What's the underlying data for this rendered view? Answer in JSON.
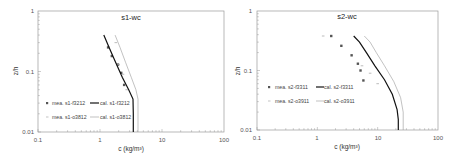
{
  "chart_data": [
    {
      "type": "scatter",
      "title": "s1-wc",
      "xlabel": "c (kg/m³)",
      "ylabel": "z/h",
      "xscale": "log",
      "yscale": "log",
      "xlim": [
        0.1,
        100
      ],
      "ylim": [
        0.01,
        1
      ],
      "xticks": [
        "0.1",
        "1",
        "10",
        "100"
      ],
      "yticks": [
        "0.01",
        "0.1",
        "1"
      ],
      "grid": false,
      "legend_position": "lower-left inside",
      "series": [
        {
          "name": "mea. s1-f3212",
          "kind": "marker",
          "marker": "square",
          "color": "#555555",
          "x": [
            1.35,
            1.55,
            1.95,
            2.2,
            2.45
          ],
          "y": [
            0.25,
            0.18,
            0.13,
            0.095,
            0.06
          ]
        },
        {
          "name": "cal. s1-f3212",
          "kind": "line",
          "style": "solid",
          "color": "#111111",
          "x": [
            1.15,
            1.4,
            1.8,
            2.3,
            2.9,
            3.4,
            3.45,
            3.45
          ],
          "y": [
            0.4,
            0.25,
            0.14,
            0.08,
            0.05,
            0.035,
            0.02,
            0.01
          ]
        },
        {
          "name": "mea. s1-o3812",
          "kind": "marker",
          "marker": "dash",
          "color": "#aaaaaa",
          "x": [
            1.8,
            2.0,
            2.35,
            2.7
          ],
          "y": [
            0.3,
            0.13,
            0.09,
            0.05
          ]
        },
        {
          "name": "cal. s1-o3812",
          "kind": "line",
          "style": "solid-thin",
          "color": "#999999",
          "x": [
            1.75,
            2.1,
            2.6,
            3.2,
            3.8,
            4.1,
            4.1
          ],
          "y": [
            0.4,
            0.25,
            0.14,
            0.08,
            0.05,
            0.035,
            0.01
          ]
        }
      ]
    },
    {
      "type": "scatter",
      "title": "s2-wc",
      "xlabel": "c (kg/m³)",
      "ylabel": "z/h",
      "xscale": "log",
      "yscale": "log",
      "xlim": [
        0.1,
        100
      ],
      "ylim": [
        0.01,
        1
      ],
      "xticks": [
        "0.1",
        "1",
        "10",
        "100"
      ],
      "yticks": [
        "0.01",
        "0.1",
        "1"
      ],
      "grid": false,
      "legend_position": "lower-left inside",
      "series": [
        {
          "name": "mea. s2-f3311",
          "kind": "marker",
          "marker": "square",
          "color": "#555555",
          "x": [
            1.7,
            2.5,
            3.7,
            4.7,
            5.2,
            5.8
          ],
          "y": [
            0.38,
            0.26,
            0.18,
            0.13,
            0.1,
            0.068
          ]
        },
        {
          "name": "cal. s2-f3311",
          "kind": "line",
          "style": "solid",
          "color": "#111111",
          "x": [
            4.0,
            5.0,
            6.5,
            9.0,
            13.0,
            17.5,
            21.0,
            22.0,
            22.0
          ],
          "y": [
            0.38,
            0.3,
            0.2,
            0.12,
            0.07,
            0.04,
            0.022,
            0.015,
            0.01
          ]
        },
        {
          "name": "mea. s2-o3911",
          "kind": "marker",
          "marker": "dash",
          "color": "#aaaaaa",
          "x": [
            1.25,
            5.5,
            7.5,
            10.0
          ],
          "y": [
            0.38,
            0.12,
            0.09,
            0.06
          ]
        },
        {
          "name": "cal. s2-o3911",
          "kind": "line",
          "style": "solid-thin",
          "color": "#999999",
          "x": [
            6.0,
            7.5,
            9.5,
            13.0,
            18.5,
            24.0,
            26.5,
            26.5
          ],
          "y": [
            0.38,
            0.3,
            0.2,
            0.12,
            0.065,
            0.035,
            0.02,
            0.01
          ]
        }
      ]
    }
  ],
  "charts": [
    {
      "title": "s1-wc",
      "ylabel": "z/h",
      "xlabel": "c (kg/m³)",
      "y_ticks": [
        "1",
        "0.1",
        "0.01"
      ],
      "x_ticks": [
        "0.1",
        "1",
        "10",
        "100"
      ],
      "legend": [
        "mea. s1-f3212",
        "cal. s1-f3212",
        "mea. s1-o3812",
        "cal. s1-o3812"
      ]
    },
    {
      "title": "s2-wc",
      "ylabel": "z/h",
      "xlabel": "c (kg/m³)",
      "y_ticks": [
        "1",
        "0.1",
        "0.01"
      ],
      "x_ticks": [
        "0.1",
        "1",
        "10",
        "100"
      ],
      "legend": [
        "mea. s2-f3311",
        "cal. s2-f3311",
        "mea. s2-o3911",
        "cal. s2-o3911"
      ]
    }
  ]
}
